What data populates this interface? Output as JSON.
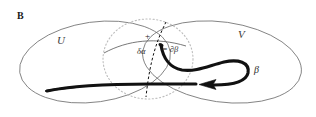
{
  "figure": {
    "panel_label": "B",
    "domain": "diagram",
    "width": 316,
    "height": 117,
    "background_color": "#ffffff"
  },
  "labels": {
    "panel": "B",
    "set_left": "U",
    "set_right": "V",
    "marked_point": "+",
    "delta_alpha": "δα",
    "boundary_expr": "= ∂β",
    "curve_beta": "β"
  },
  "colors": {
    "set_outline": "#6e6e6e",
    "dotted_circle": "#b8b8b8",
    "dashed_divider": "#111111",
    "thick_curve": "#111111",
    "thin_curve": "#555555",
    "text": "#1a1a1a"
  },
  "elements": {
    "ellipse_u": {
      "name": "set-region-u",
      "cx": 95,
      "cy": 62,
      "rx": 76,
      "ry": 40,
      "rotation_deg": -8
    },
    "ellipse_v": {
      "name": "set-region-v",
      "cx": 222,
      "cy": 62,
      "rx": 80,
      "ry": 40,
      "rotation_deg": 8
    },
    "dotted_circle": {
      "name": "neighborhood-circle",
      "cx": 148,
      "cy": 59,
      "rx": 45,
      "ry": 40
    },
    "dashed_divider": {
      "name": "overlap-divider",
      "from": [
        166,
        22
      ],
      "to": [
        146,
        97
      ]
    },
    "thick_curve": {
      "name": "oriented-curve-beta",
      "arrow_tip": [
        200,
        85
      ],
      "arrow_direction": "left",
      "start_point": [
        47,
        91
      ],
      "end_point": [
        161,
        45
      ]
    },
    "thin_curve": {
      "name": "delta-alpha-arc",
      "from": [
        104,
        53
      ],
      "to": [
        186,
        46
      ]
    }
  }
}
